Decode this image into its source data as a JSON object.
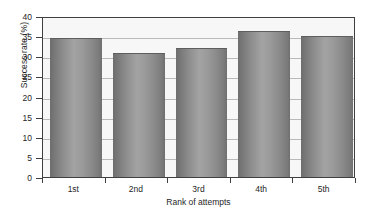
{
  "chart_data": {
    "type": "bar",
    "title": "",
    "subtitle": "",
    "categories": [
      "1st",
      "2nd",
      "3rd",
      "4th",
      "5th"
    ],
    "values": [
      34.5,
      30.8,
      32.0,
      36.3,
      35.1
    ],
    "xlabel": "Rank of attempts",
    "ylabel": "Success rate (%)",
    "ylim": [
      0,
      40
    ],
    "yticks": [
      0,
      5,
      10,
      15,
      20,
      25,
      30,
      35,
      40
    ],
    "ytick_labels": [
      "0",
      "5",
      "10",
      "15",
      "20",
      "25",
      "30",
      "35",
      "40"
    ],
    "grid": true,
    "grid_axis": "y",
    "legend": false,
    "legend_position": "none",
    "annotations": [],
    "series": [
      {
        "name": "Success rate",
        "values": [
          34.5,
          30.8,
          32.0,
          36.3,
          35.1
        ]
      }
    ],
    "colors": {
      "bar_dark": "#6d6d6d",
      "bar_light": "#a3a3a3",
      "plot_background": "#f7f7f7",
      "gridline": "#b9b9b9",
      "axis": "#3f3f3f",
      "text": "#1f1f1f",
      "page_background": "#ffffff"
    }
  }
}
